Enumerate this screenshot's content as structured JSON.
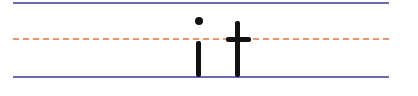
{
  "worksheet": {
    "word": "it",
    "letters": [
      "i",
      "t"
    ],
    "colors": {
      "guide_line": "#6b6bb5",
      "midline": "#f0956a",
      "ink": "#111111"
    }
  }
}
